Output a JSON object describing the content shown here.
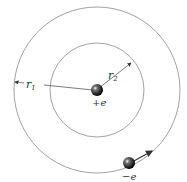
{
  "diagram": {
    "nucleus": {
      "label": "+e"
    },
    "electron": {
      "label": "−e"
    },
    "radii": [
      {
        "symbol": "r",
        "subscript": "1"
      },
      {
        "symbol": "r",
        "subscript": "2"
      }
    ],
    "colors": {
      "orbit": "#8a8a8a",
      "line": "#444444",
      "particle": "#111111"
    }
  }
}
